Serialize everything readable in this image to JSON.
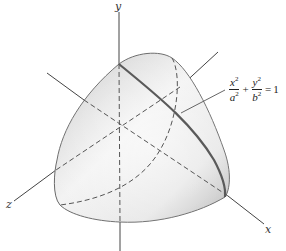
{
  "figure": {
    "axes": {
      "x_label": "x",
      "y_label": "y",
      "z_label": "z"
    },
    "equation": {
      "term1_num": "x",
      "term1_den": "a",
      "term2_num": "y",
      "term2_den": "b",
      "exponent": "2",
      "plus": "+",
      "equals": "=",
      "rhs": "1"
    },
    "colors": {
      "surface_light": "#f4f4f4",
      "surface_dark": "#bdbdbd",
      "outline": "#6a6a6a",
      "curve": "#5a5a5a",
      "axis": "#444444"
    }
  }
}
